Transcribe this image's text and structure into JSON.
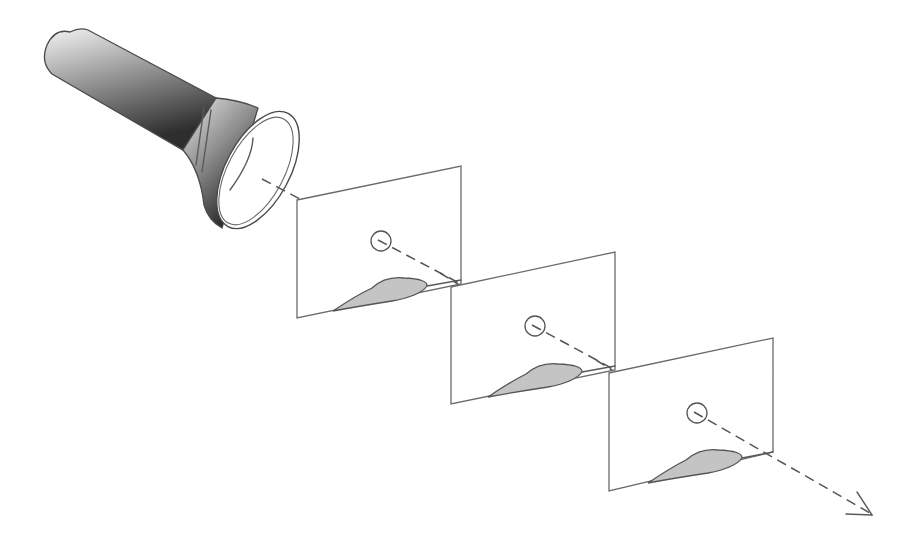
{
  "diagram": {
    "colors": {
      "background": "#ffffff",
      "line": "#5a5a5a",
      "airfoil_fill": "#c4c4c4",
      "flashlight_dark": "#3a3a3a",
      "flashlight_light": "#f2f2f2"
    },
    "flashlight": {
      "icon": "flashlight-icon",
      "lens_center": [
        268,
        183
      ]
    },
    "beam": {
      "style": "dashed",
      "start": [
        268,
        183
      ],
      "end": [
        872,
        515
      ],
      "arrowhead": "arrow-icon"
    },
    "panels": [
      {
        "id": 1,
        "corners": [
          [
            297,
            200
          ],
          [
            461,
            166
          ],
          [
            461,
            284
          ],
          [
            297,
            318
          ]
        ],
        "hole_center": [
          381,
          241
        ],
        "hole_radius": 10,
        "airfoil": {
          "trailing_edge": [
            333,
            311
          ],
          "leading_edge": [
            427,
            286
          ],
          "peak": [
            386,
            278
          ]
        }
      },
      {
        "id": 2,
        "corners": [
          [
            451,
            287
          ],
          [
            615,
            252
          ],
          [
            615,
            370
          ],
          [
            451,
            404
          ]
        ],
        "hole_center": [
          535,
          326
        ],
        "hole_radius": 10,
        "airfoil": {
          "trailing_edge": [
            488,
            397
          ],
          "leading_edge": [
            582,
            372
          ],
          "peak": [
            540,
            364
          ]
        }
      },
      {
        "id": 3,
        "corners": [
          [
            609,
            373
          ],
          [
            773,
            338
          ],
          [
            773,
            452
          ],
          [
            609,
            491
          ]
        ],
        "hole_center": [
          697,
          413
        ],
        "hole_radius": 10,
        "airfoil": {
          "trailing_edge": [
            648,
            483
          ],
          "leading_edge": [
            742,
            458
          ],
          "peak": [
            700,
            450
          ]
        }
      }
    ]
  }
}
